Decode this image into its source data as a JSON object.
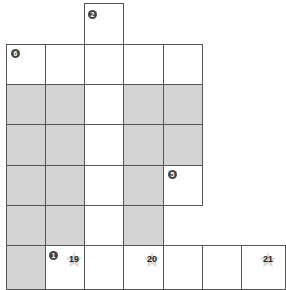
{
  "puzzle": {
    "clues": {
      "top_clue": "2",
      "left_clue": "6",
      "right_clue": "5",
      "bottom_clue": "1"
    },
    "stars": {
      "star_a": "19",
      "star_b": "20",
      "star_c": "21"
    },
    "colors": {
      "shaded": "#d4d4d4",
      "border": "#555555"
    }
  }
}
